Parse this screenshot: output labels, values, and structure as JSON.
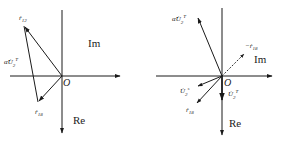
{
  "diagrams": [
    {
      "id": "left",
      "origin_label": "O",
      "axes": {
        "horizontal_label": "Im",
        "vertical_label": "Re"
      },
      "vectors": [
        {
          "name": "r12",
          "label_base": "ṙ",
          "label_sub": "12",
          "label_sup": ""
        },
        {
          "name": "r18",
          "label_base": "ṙ",
          "label_sub": "18",
          "label_sup": ""
        },
        {
          "name": "alpha-U2T",
          "label_base": "α̂U̇",
          "label_sub": "2",
          "label_sup": "T"
        }
      ]
    },
    {
      "id": "right",
      "origin_label": "O",
      "axes": {
        "horizontal_label": "Im",
        "vertical_label": "Re"
      },
      "vectors": [
        {
          "name": "alpha-U2T",
          "label_base": "α̂U̇",
          "label_sub": "2",
          "label_sup": "T"
        },
        {
          "name": "neg-r18",
          "label_base": "−ṙ",
          "label_sub": "18",
          "label_sup": ""
        },
        {
          "name": "U2s",
          "label_base": "U̇",
          "label_sub": "2",
          "label_sup": "s"
        },
        {
          "name": "r18",
          "label_base": "ṙ",
          "label_sub": "18",
          "label_sup": ""
        },
        {
          "name": "U2T",
          "label_base": "U̇",
          "label_sub": "2",
          "label_sup": "T"
        }
      ]
    }
  ],
  "colors": {
    "ink": "#1a1a1a",
    "background": "#ffffff"
  }
}
